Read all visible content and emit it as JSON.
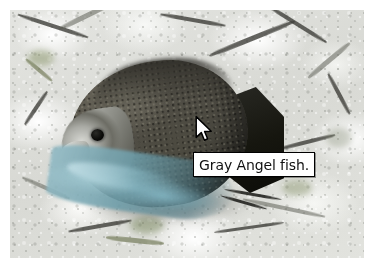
{
  "screen": {
    "width": 377,
    "height": 272,
    "background_color": "#ffffff"
  },
  "photo": {
    "alt": "Underwater photograph of a gray angelfish in front of white coral reef",
    "subject": "Gray Angel fish",
    "scene": "coral reef",
    "background_color": "#dfe0dd",
    "fish_body_color": "#4c4a40",
    "fish_head_color": "#a9aaa4",
    "fish_ventral_fin_color": "#8ab9c5",
    "fish_tail_color": "#14140f",
    "fish_eye_color": "#000000"
  },
  "tooltip": {
    "text": "Gray Angel fish.",
    "background_color": "#ffffff",
    "border_color": "#000000",
    "text_color": "#111111"
  },
  "cursor": {
    "type": "arrow-pointer",
    "fill_color": "#ffffff",
    "outline_color": "#000000"
  }
}
